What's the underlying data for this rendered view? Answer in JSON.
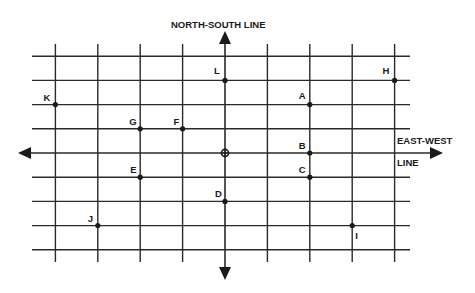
{
  "diagram": {
    "type": "coordinate-grid",
    "ns_axis_label": "NORTH-SOUTH LINE",
    "ew_axis_label_line1": "EAST-WEST",
    "ew_axis_label_line2": "LINE",
    "grid": {
      "x_min": -4,
      "x_max": 4,
      "y_min": -4,
      "y_max": 4
    },
    "origin_marker": "crosshair-circle",
    "colors": {
      "line": "#2a2a2a",
      "text": "#1a1a1a",
      "background": "#ffffff"
    },
    "points": [
      {
        "label": "A",
        "x": 2,
        "y": 2
      },
      {
        "label": "B",
        "x": 2,
        "y": 0
      },
      {
        "label": "C",
        "x": 2,
        "y": -1
      },
      {
        "label": "D",
        "x": 0,
        "y": -2
      },
      {
        "label": "E",
        "x": -2,
        "y": -1
      },
      {
        "label": "F",
        "x": -1,
        "y": 1
      },
      {
        "label": "G",
        "x": -2,
        "y": 1
      },
      {
        "label": "H",
        "x": 4,
        "y": 3
      },
      {
        "label": "I",
        "x": 3,
        "y": -3
      },
      {
        "label": "J",
        "x": -3,
        "y": -3
      },
      {
        "label": "K",
        "x": -4,
        "y": 2
      },
      {
        "label": "L",
        "x": 0,
        "y": 3
      }
    ]
  }
}
